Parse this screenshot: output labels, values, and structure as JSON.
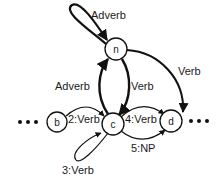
{
  "diagram": {
    "nodes": [
      {
        "id": "n",
        "label": "n",
        "x": 116,
        "y": 49
      },
      {
        "id": "b",
        "label": "b",
        "x": 57,
        "y": 122
      },
      {
        "id": "c",
        "label": "c",
        "x": 113,
        "y": 124
      },
      {
        "id": "d",
        "label": "d",
        "x": 171,
        "y": 121
      }
    ],
    "edges": [
      {
        "from": "n",
        "to": "n",
        "label": "Adverb"
      },
      {
        "from": "c",
        "to": "n",
        "label": "Adverb"
      },
      {
        "from": "n",
        "to": "c",
        "label": "Verb"
      },
      {
        "from": "n",
        "to": "d",
        "label": "Verb"
      },
      {
        "from": "b",
        "to": "c",
        "label": "2:Verb"
      },
      {
        "from": "c",
        "to": "c",
        "label": "3:Verb"
      },
      {
        "from": "c",
        "to": "d",
        "label": "4:Verb"
      },
      {
        "from": "c",
        "to": "d",
        "label": "5:NP"
      }
    ],
    "ellipsis_left": "•••",
    "ellipsis_right": "•••"
  }
}
